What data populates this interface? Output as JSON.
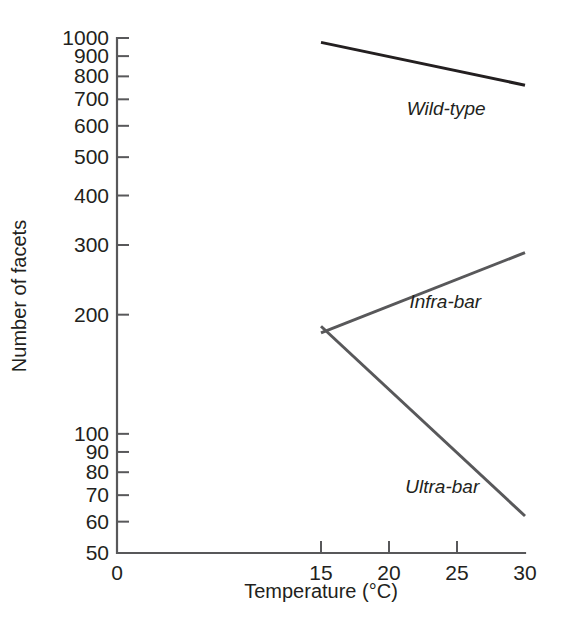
{
  "chart_data": {
    "type": "line",
    "title": "",
    "xlabel": "Temperature (°C)",
    "ylabel": "Number of facets",
    "yscale": "log",
    "ylim": [
      50,
      1000
    ],
    "xlim": [
      0,
      30
    ],
    "grid": false,
    "legend": "inline-labels",
    "x_ticks": [
      {
        "value": 0,
        "label": "0"
      },
      {
        "value": 15,
        "label": "15"
      },
      {
        "value": 20,
        "label": "20"
      },
      {
        "value": 25,
        "label": "25"
      },
      {
        "value": 30,
        "label": "30"
      }
    ],
    "y_ticks": [
      {
        "value": 1000,
        "label": "1000"
      },
      {
        "value": 900,
        "label": "900"
      },
      {
        "value": 800,
        "label": "800"
      },
      {
        "value": 700,
        "label": "700"
      },
      {
        "value": 600,
        "label": "600"
      },
      {
        "value": 500,
        "label": "500"
      },
      {
        "value": 400,
        "label": "400"
      },
      {
        "value": 300,
        "label": "300"
      },
      {
        "value": 200,
        "label": "200"
      },
      {
        "value": 100,
        "label": "100"
      },
      {
        "value": 90,
        "label": "90"
      },
      {
        "value": 80,
        "label": "80"
      },
      {
        "value": 70,
        "label": "70"
      },
      {
        "value": 60,
        "label": "60"
      },
      {
        "value": 50,
        "label": "50"
      }
    ],
    "series": [
      {
        "name": "Wild-type",
        "color": "#231f20",
        "x": [
          15,
          30
        ],
        "values": [
          975,
          760
        ],
        "label_x": 21.3,
        "label_y": 640
      },
      {
        "name": "Infra-bar",
        "color": "#58585a",
        "x": [
          15,
          30
        ],
        "values": [
          180,
          287
        ],
        "label_x": 21.5,
        "label_y": 208
      },
      {
        "name": "Ultra-bar",
        "color": "#58585a",
        "x": [
          15,
          30
        ],
        "values": [
          187,
          62
        ],
        "label_x": 21.2,
        "label_y": 71
      }
    ]
  },
  "colors": {
    "axis": "#58585a",
    "text": "#231f20",
    "background": "#ffffff"
  }
}
